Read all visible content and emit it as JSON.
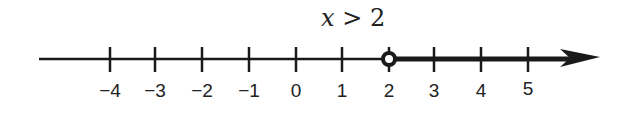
{
  "title": {
    "variable": "x",
    "relation": " > 2"
  },
  "number_line": {
    "ticks": [
      {
        "value": -4,
        "label": "−4",
        "x": 110
      },
      {
        "value": -3,
        "label": "−3",
        "x": 155
      },
      {
        "value": -2,
        "label": "−2",
        "x": 202
      },
      {
        "value": -1,
        "label": "−1",
        "x": 249
      },
      {
        "value": 0,
        "label": "0",
        "x": 296
      },
      {
        "value": 1,
        "label": "1",
        "x": 342
      },
      {
        "value": 2,
        "label": "2",
        "x": 389
      },
      {
        "value": 3,
        "label": "3",
        "x": 434
      },
      {
        "value": 4,
        "label": "4",
        "x": 481
      },
      {
        "value": 5,
        "label": "5",
        "x": 528
      }
    ],
    "open_point": 2,
    "shaded_direction": "right",
    "inequality": "x > 2"
  }
}
